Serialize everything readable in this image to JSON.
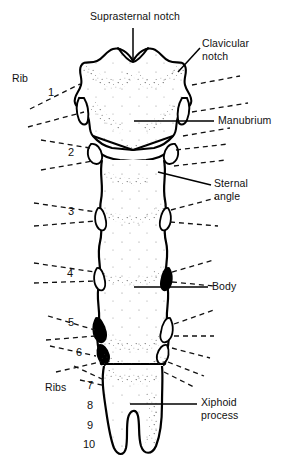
{
  "figure": {
    "line_color": "#000000",
    "background_color": "#ffffff",
    "stipple_color": "#3a3a3a"
  },
  "labels": {
    "suprasternal_notch": "Suprasternal notch",
    "clavicular_notch_line1": "Clavicular",
    "clavicular_notch_line2": "notch",
    "rib": "Rib",
    "manubrium": "Manubrium",
    "sternal_angle_line1": "Sternal",
    "sternal_angle_line2": "angle",
    "body": "Body",
    "ribs": "Ribs",
    "xiphoid_process_line1": "Xiphoid",
    "xiphoid_process_line2": "process"
  },
  "rib_numbers": {
    "n1": "1",
    "n2": "2",
    "n3": "3",
    "n4": "4",
    "n5": "5",
    "n6": "6",
    "n7": "7",
    "n8": "8",
    "n9": "9",
    "n10": "10"
  }
}
